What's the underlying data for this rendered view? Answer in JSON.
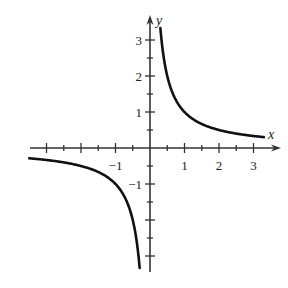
{
  "chart_data": {
    "type": "line",
    "title": "",
    "function": "y = 1/x",
    "xlabel": "x",
    "ylabel": "y",
    "xlim": [
      -3.5,
      3.5
    ],
    "ylim": [
      -3.5,
      3.5
    ],
    "grid": false,
    "x_tick_labels": [
      {
        "value": -1,
        "text": "−1"
      },
      {
        "value": 1,
        "text": "1"
      },
      {
        "value": 2,
        "text": "2"
      },
      {
        "value": 3,
        "text": "3"
      }
    ],
    "y_tick_labels": [
      {
        "value": 3,
        "text": "3"
      },
      {
        "value": 2,
        "text": "2"
      },
      {
        "value": 1,
        "text": "1"
      },
      {
        "value": -1,
        "text": "−1"
      }
    ],
    "minor_tick_step": 0.5,
    "series": [
      {
        "name": "right-branch",
        "x_range": [
          0.3,
          3.3
        ]
      },
      {
        "name": "left-branch",
        "x_range": [
          -3.5,
          -0.3
        ]
      }
    ],
    "line_color": "#111111",
    "axis_color": "#333333"
  },
  "layout": {
    "origin_px": [
      150,
      148
    ],
    "scale_x": 34.5,
    "scale_y": 36,
    "x_axis_px": [
      30,
      281
    ],
    "y_axis_px": [
      15,
      272
    ]
  }
}
